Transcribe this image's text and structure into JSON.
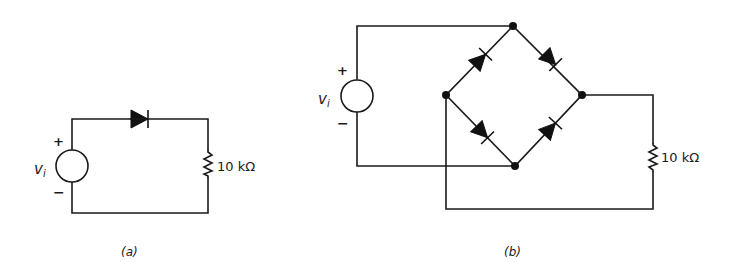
{
  "figure_a": {
    "caption": "(a)",
    "source": {
      "label_main": "v",
      "label_sub": "i",
      "plus": "+",
      "minus": "−"
    },
    "resistor": {
      "label": "10 kΩ"
    },
    "diode": {
      "orientation": "right"
    }
  },
  "figure_b": {
    "caption": "(b)",
    "source": {
      "label_main": "v",
      "label_sub": "i",
      "plus": "+",
      "minus": "−"
    },
    "resistor": {
      "label": "10 kΩ"
    },
    "bridge": {
      "diodes": [
        {
          "position": "upper-left",
          "direction": "left-node to top-node"
        },
        {
          "position": "upper-right",
          "direction": "top-node to right-node"
        },
        {
          "position": "lower-left",
          "direction": "left-node to bottom-node"
        },
        {
          "position": "lower-right",
          "direction": "bottom-node to right-node"
        }
      ],
      "nodes": [
        "top",
        "left",
        "right",
        "bottom"
      ]
    }
  },
  "colors": {
    "ink": "#1a1a1a",
    "background": "#ffffff"
  }
}
